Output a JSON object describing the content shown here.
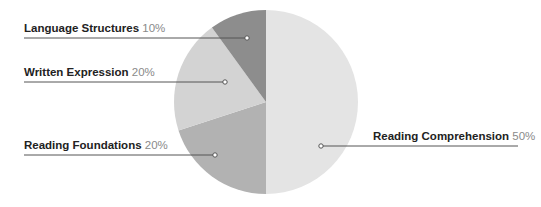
{
  "chart_data": {
    "type": "pie",
    "title": "",
    "slices": [
      {
        "label": "Reading Comprehension",
        "value": 50,
        "display": "50%",
        "color": "#e4e4e4"
      },
      {
        "label": "Reading Foundations",
        "value": 20,
        "display": "20%",
        "color": "#b2b2b2"
      },
      {
        "label": "Written Expression",
        "value": 20,
        "display": "20%",
        "color": "#d3d3d3"
      },
      {
        "label": "Language Structures",
        "value": 10,
        "display": "10%",
        "color": "#8d8d8d"
      }
    ],
    "start_angle": "12 o'clock, clockwise",
    "legend": "callout labels with leader lines"
  },
  "labels": {
    "rc": {
      "name": "Reading Comprehension",
      "pct": "50%"
    },
    "rf": {
      "name": "Reading Foundations",
      "pct": "20%"
    },
    "we": {
      "name": "Written Expression",
      "pct": "20%"
    },
    "ls": {
      "name": "Language Structures",
      "pct": "10%"
    }
  }
}
